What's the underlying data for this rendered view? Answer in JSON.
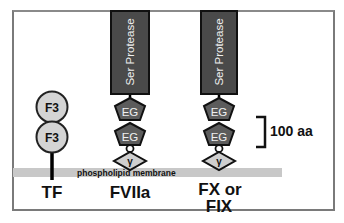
{
  "diagram": {
    "membrane_label": "phospholipid membrane",
    "scale_bar_label": "100 aa",
    "proteins": [
      {
        "name": "TF",
        "domains": [
          "F3",
          "F3"
        ]
      },
      {
        "name": "FVIIa",
        "domains": [
          "Ser Protease",
          "EG",
          "EG",
          "γ"
        ]
      },
      {
        "name_line1": "FX or",
        "name_line2": "FIX",
        "domains": [
          "Ser Protease",
          "EG",
          "EG",
          "γ"
        ]
      }
    ],
    "colors": {
      "protease_fill": "#4a4a4a",
      "eg_fill": "#5c5c5c",
      "light_domain_fill": "#cfcfcf",
      "membrane_fill": "#c8c8c8",
      "frame": "#7a7a7a"
    }
  }
}
